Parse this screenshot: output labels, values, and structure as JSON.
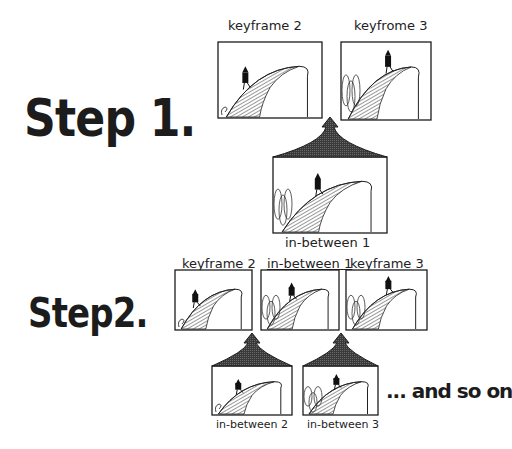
{
  "steps": [
    {
      "title": "Step 1.",
      "keyframes": [
        {
          "label": "keyframe 2",
          "figure_position": "lower-slope",
          "trees": "small-curl"
        },
        {
          "label": "keyfrome 3",
          "figure_position": "top-of-hill",
          "trees": "bushes"
        }
      ],
      "inbetweens": [
        {
          "label": "in-between 1",
          "figure_position": "mid-slope",
          "trees": "bushes"
        }
      ]
    },
    {
      "title": "Step2.",
      "keyframes": [
        {
          "label": "keyframe 2",
          "figure_position": "lower-slope",
          "trees": "small-curl"
        },
        {
          "label": "in-between 1",
          "figure_position": "mid-slope",
          "trees": "bushes"
        },
        {
          "label": "keyframe  3",
          "figure_position": "top-of-hill",
          "trees": "bushes"
        }
      ],
      "inbetweens": [
        {
          "label": "in-between 2",
          "figure_position": "lower-mid-slope",
          "trees": "small-curl"
        },
        {
          "label": "in-between 3",
          "figure_position": "upper-mid-slope",
          "trees": "bushes"
        }
      ]
    }
  ],
  "continuation": "... and so on",
  "colors": {
    "ink": "#1c1c1c",
    "paper": "#ffffff",
    "arrow": "#2a2a2a"
  }
}
